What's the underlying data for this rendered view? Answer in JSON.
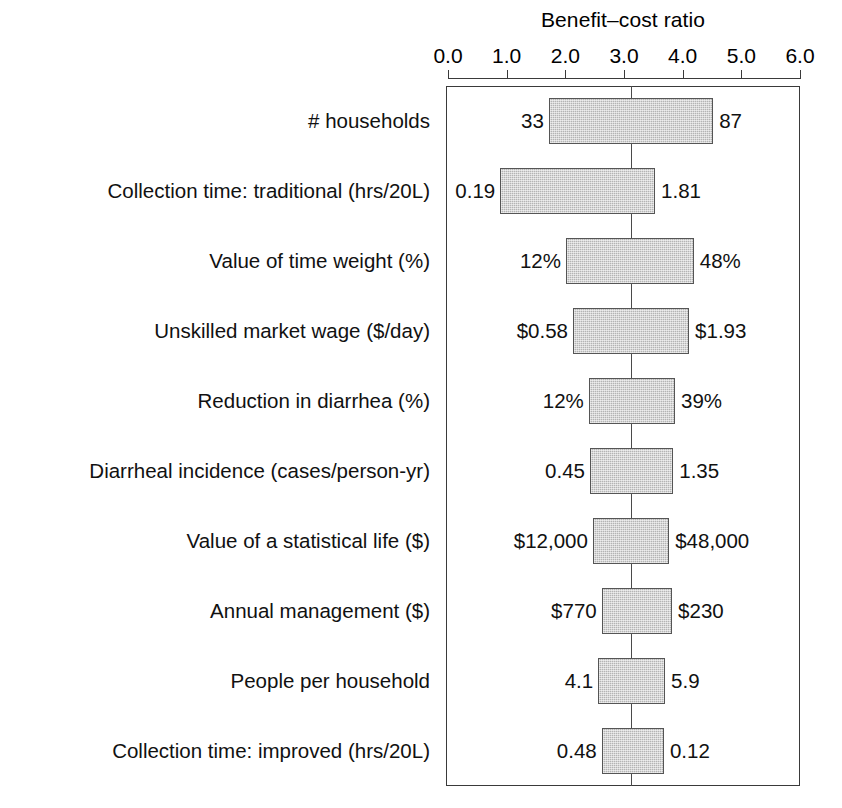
{
  "chart_data": {
    "type": "bar",
    "chart_style": "tornado-diagram",
    "title": "",
    "xlabel": "Benefit–cost ratio",
    "ylabel": "",
    "xlim": [
      0.0,
      6.0
    ],
    "xticks": [
      "0.0",
      "1.0",
      "2.0",
      "3.0",
      "4.0",
      "5.0",
      "6.0"
    ],
    "xtick_values": [
      0.0,
      1.0,
      2.0,
      3.0,
      4.0,
      5.0,
      6.0
    ],
    "grid": false,
    "legend": "none",
    "baseline_value": 3.12,
    "categories": [
      "# households",
      "Collection time: traditional (hrs/20L)",
      "Value of time weight (%)",
      "Unskilled market wage ($/day)",
      "Reduction in diarrhea (%)",
      "Diarrheal incidence (cases/person-yr)",
      "Value of a statistical life ($)",
      "Annual management ($)",
      "People per household",
      "Collection time: improved (hrs/20L)"
    ],
    "bars": [
      {
        "category": "# households",
        "low_ratio": 1.72,
        "high_ratio": 4.52,
        "low_label": "33",
        "high_label": "87"
      },
      {
        "category": "Collection time: traditional (hrs/20L)",
        "low_ratio": 0.89,
        "high_ratio": 3.53,
        "low_label": "0.19",
        "high_label": "1.81"
      },
      {
        "category": "Value of time weight (%)",
        "low_ratio": 2.01,
        "high_ratio": 4.19,
        "low_label": "12%",
        "high_label": "48%"
      },
      {
        "category": "Unskilled market wage ($/day)",
        "low_ratio": 2.13,
        "high_ratio": 4.11,
        "low_label": "$0.58",
        "high_label": "$1.93"
      },
      {
        "category": "Reduction in diarrhea (%)",
        "low_ratio": 2.4,
        "high_ratio": 3.87,
        "low_label": "12%",
        "high_label": "39%"
      },
      {
        "category": "Diarrheal incidence (cases/person-yr)",
        "low_ratio": 2.42,
        "high_ratio": 3.84,
        "low_label": "0.45",
        "high_label": "1.35"
      },
      {
        "category": "Value of a statistical life ($)",
        "low_ratio": 2.47,
        "high_ratio": 3.77,
        "low_label": "$12,000",
        "high_label": "$48,000"
      },
      {
        "category": "Annual management ($)",
        "low_ratio": 2.62,
        "high_ratio": 3.82,
        "low_label": "$770",
        "high_label": "$230"
      },
      {
        "category": "People per household",
        "low_ratio": 2.56,
        "high_ratio": 3.7,
        "low_label": "4.1",
        "high_label": "5.9"
      },
      {
        "category": "Collection time: improved (hrs/20L)",
        "low_ratio": 2.62,
        "high_ratio": 3.68,
        "low_label": "0.48",
        "high_label": "0.12"
      }
    ],
    "colors": {
      "bar_fill": "#b4b4b4",
      "bar_border": "#555555",
      "axis": "#3a3a3a",
      "baseline": "#4a4a4a",
      "text": "#111111",
      "background": "#ffffff"
    }
  }
}
